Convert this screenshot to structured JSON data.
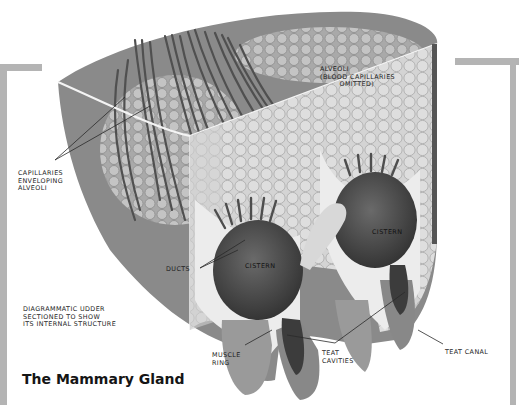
{
  "figure": {
    "title": "The Mammary Gland",
    "caption": "DIAGRAMMATIC UDDER\nSECTIONED TO SHOW\nITS INTERNAL STRUCTURE",
    "labels": {
      "capillaries": "CAPILLARIES\nENVELOPING\nALVEOLI",
      "alveoli": "ALVEOLI\n(BLOOD CAPILLARIES\n        OMITTED)",
      "ducts": "DUCTS",
      "cistern_left": "CISTERN",
      "cistern_right": "CISTERN",
      "muscle_ring": "MUSCLE\nRING",
      "teat_cavities": "TEAT\nCAVITIES",
      "teat_canal": "TEAT CANAL"
    },
    "colors": {
      "frame": "#b4b4b4",
      "udder_skin": "#8a8a8a",
      "alveoli": "#b8b8b8",
      "cistern": "#4a4a4a",
      "section_face": "#e6e6e6"
    }
  }
}
